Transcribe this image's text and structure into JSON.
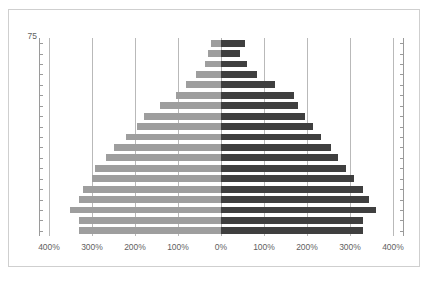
{
  "top_strip": {
    "ghost_text": ""
  },
  "chart_data": {
    "type": "bar",
    "subtype": "population-pyramid",
    "title": "",
    "xlabel": "",
    "ylabel": "",
    "orientation": "horizontal",
    "grid": true,
    "legend_position": "none",
    "xlim": [
      -400,
      400
    ],
    "x_tick_values": [
      -400,
      -300,
      -200,
      -100,
      0,
      100,
      200,
      300,
      400
    ],
    "x_tick_labels": [
      "400%",
      "300%",
      "200%",
      "100%",
      "0%",
      "100%",
      "200%",
      "300%",
      "400%"
    ],
    "y_axis_top_label": "75",
    "y_tick_count": 19,
    "colors": {
      "left_series": "#9e9e9e",
      "right_series": "#3f3f3f",
      "gridline": "#b9b9b9",
      "axis": "#9a9a9a",
      "border": "#cfcfcf",
      "background": "#ffffff",
      "text": "#5f5f5f"
    },
    "series": [
      {
        "name": "left",
        "values": [
          24,
          30,
          38,
          58,
          82,
          105,
          142,
          180,
          196,
          220,
          248,
          268,
          292,
          300,
          320,
          330,
          352,
          330,
          330
        ]
      },
      {
        "name": "right",
        "values": [
          56,
          44,
          60,
          84,
          125,
          170,
          180,
          196,
          215,
          232,
          255,
          272,
          290,
          310,
          330,
          344,
          360,
          330,
          330
        ]
      }
    ],
    "categories": [
      "age-75",
      "age-74",
      "age-73",
      "age-72",
      "age-71",
      "age-70",
      "age-69",
      "age-68",
      "age-67",
      "age-66",
      "age-65",
      "age-64",
      "age-63",
      "age-62",
      "age-61",
      "age-60",
      "age-59",
      "age-58",
      "age-57"
    ]
  }
}
